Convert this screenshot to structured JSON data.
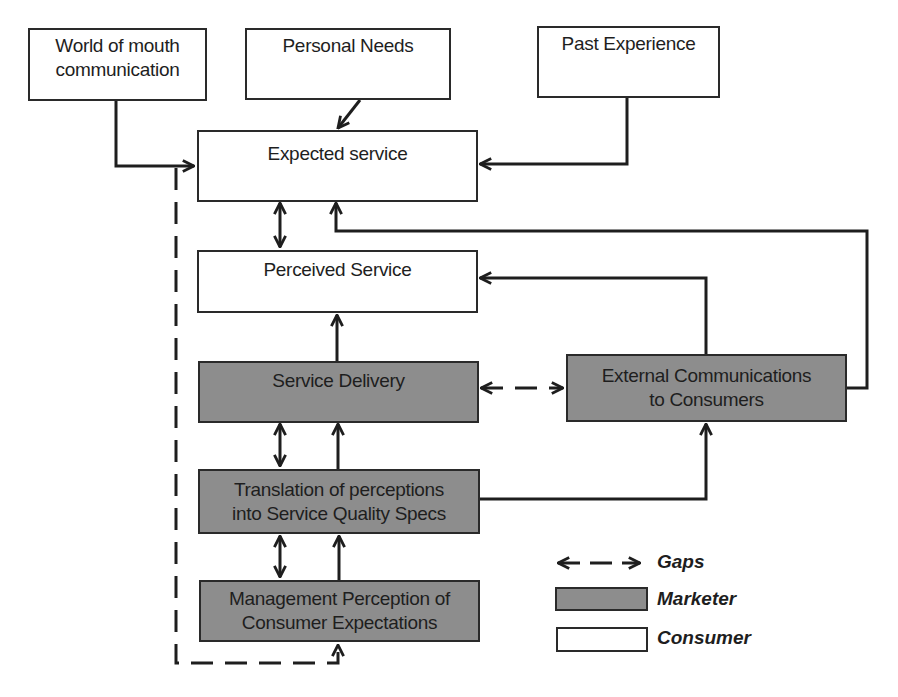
{
  "diagram": {
    "type": "service-quality-gap-model",
    "colors": {
      "marketer_fill": "#8d8d8d",
      "consumer_fill": "#ffffff",
      "stroke": "#2a2a2a"
    },
    "nodes": {
      "word_of_mouth": {
        "lines": [
          "World of mouth",
          "communication"
        ],
        "group": "consumer"
      },
      "personal_needs": {
        "lines": [
          "Personal Needs"
        ],
        "group": "consumer"
      },
      "past_experience": {
        "lines": [
          "Past Experience"
        ],
        "group": "consumer"
      },
      "expected_service": {
        "lines": [
          "Expected service"
        ],
        "group": "consumer"
      },
      "perceived_service": {
        "lines": [
          "Perceived Service"
        ],
        "group": "consumer"
      },
      "service_delivery": {
        "lines": [
          "Service Delivery"
        ],
        "group": "marketer"
      },
      "external_communications": {
        "lines": [
          "External Communications",
          "to Consumers"
        ],
        "group": "marketer"
      },
      "translation": {
        "lines": [
          "Translation of perceptions",
          "into Service Quality Specs"
        ],
        "group": "marketer"
      },
      "management_perception": {
        "lines": [
          "Management Perception of",
          "Consumer Expectations"
        ],
        "group": "marketer"
      }
    },
    "edges": [
      {
        "from": "word_of_mouth",
        "to": "expected_service",
        "style": "solid"
      },
      {
        "from": "personal_needs",
        "to": "expected_service",
        "style": "solid"
      },
      {
        "from": "past_experience",
        "to": "expected_service",
        "style": "solid"
      },
      {
        "from": "expected_service",
        "to": "perceived_service",
        "style": "gap-bidirectional"
      },
      {
        "from": "service_delivery",
        "to": "perceived_service",
        "style": "solid"
      },
      {
        "from": "external_communications",
        "to": "perceived_service",
        "style": "solid"
      },
      {
        "from": "external_communications",
        "to": "expected_service",
        "style": "solid"
      },
      {
        "from": "service_delivery",
        "to": "external_communications",
        "style": "gap-dashed-bidirectional"
      },
      {
        "from": "translation",
        "to": "service_delivery",
        "style": "solid"
      },
      {
        "from": "service_delivery",
        "to": "translation",
        "style": "gap-bidirectional"
      },
      {
        "from": "translation",
        "to": "external_communications",
        "style": "solid"
      },
      {
        "from": "management_perception",
        "to": "translation",
        "style": "solid"
      },
      {
        "from": "translation",
        "to": "management_perception",
        "style": "gap-bidirectional"
      },
      {
        "from": "expected_service",
        "to": "management_perception",
        "style": "gap-dashed"
      }
    ],
    "legend": {
      "gaps": "Gaps",
      "marketer": "Marketer",
      "consumer": "Consumer"
    }
  }
}
